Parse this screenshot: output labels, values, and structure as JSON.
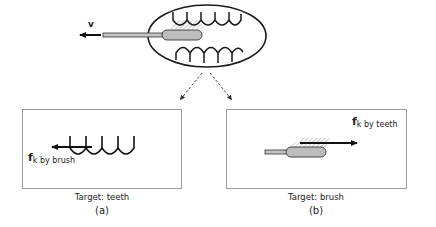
{
  "top_figure": {
    "velocity_label": "v",
    "description": "toothbrush inside mouth moving left"
  },
  "panel_a": {
    "force_symbol": "f",
    "force_subscript": "k by brush",
    "target_caption": "Target: teeth",
    "panel_label": "(a)"
  },
  "panel_b": {
    "force_symbol": "f",
    "force_subscript": "k by teeth",
    "target_caption": "Target: brush",
    "panel_label": "(b)"
  },
  "colors": {
    "stroke": "#1a1a1a",
    "brush_fill": "#bdbdbd",
    "box_border": "#9a9a9a",
    "hatch": "#888888"
  }
}
